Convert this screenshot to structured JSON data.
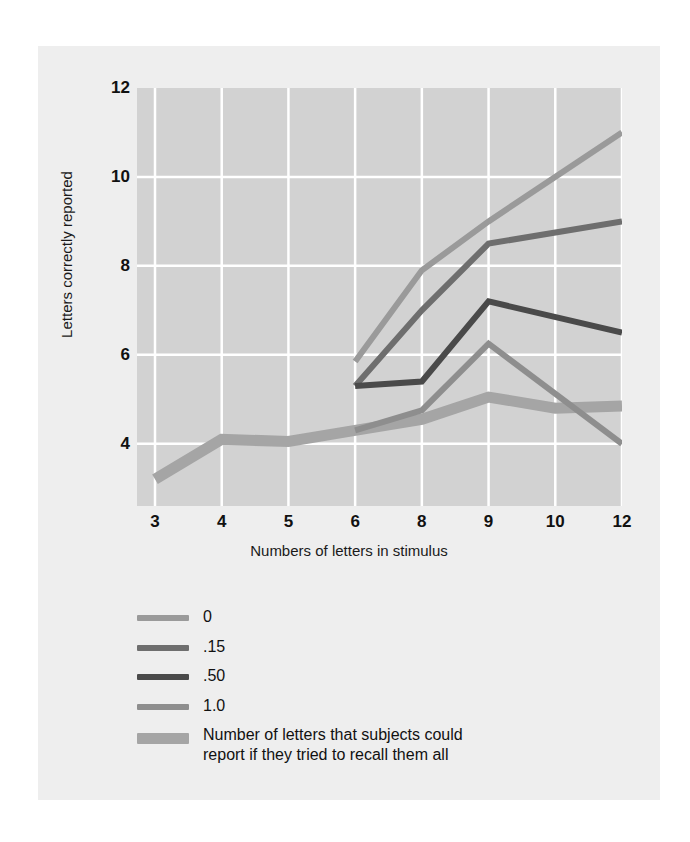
{
  "figure": {
    "background": "#eeeeee",
    "plot_background": "#d2d2d2",
    "gridline_color": "#ffffff"
  },
  "axes": {
    "ylabel": "Letters correctly reported",
    "xlabel": "Numbers of letters in stimulus",
    "yticks": [
      "4",
      "6",
      "8",
      "10",
      "12"
    ],
    "xticks": [
      "3",
      "4",
      "5",
      "6",
      "8",
      "9",
      "10",
      "12"
    ]
  },
  "legend": {
    "items": [
      {
        "label": "0",
        "color": "#9a9a9a",
        "thickness": 6
      },
      {
        "label": ".15",
        "color": "#6e6e6e",
        "thickness": 6
      },
      {
        "label": ".50",
        "color": "#4a4a4a",
        "thickness": 6
      },
      {
        "label": "1.0",
        "color": "#8e8e8e",
        "thickness": 6
      },
      {
        "label": "Number of letters that subjects could",
        "label_line2": "report if they tried to recall them all",
        "color": "#a5a5a5",
        "thickness": 11
      }
    ]
  },
  "chart_data": {
    "type": "line",
    "title": "",
    "xlabel": "Numbers of letters in stimulus",
    "ylabel": "Letters correctly reported",
    "categories": [
      "3",
      "4",
      "5",
      "6",
      "8",
      "9",
      "10",
      "12"
    ],
    "xlim": [
      0,
      7
    ],
    "ylim": [
      2.6,
      12
    ],
    "grid": true,
    "legend_position": "below",
    "series": [
      {
        "name": "0",
        "color": "#9a9a9a",
        "thickness": 6,
        "x": [
          "6",
          "8",
          "9",
          "12"
        ],
        "values": [
          5.85,
          7.9,
          9.0,
          11.0
        ]
      },
      {
        "name": ".15",
        "color": "#6e6e6e",
        "thickness": 6,
        "x": [
          "6",
          "8",
          "9",
          "12"
        ],
        "values": [
          5.3,
          7.0,
          8.5,
          9.0
        ]
      },
      {
        "name": ".50",
        "color": "#4a4a4a",
        "thickness": 6,
        "x": [
          "6",
          "8",
          "9",
          "12"
        ],
        "values": [
          5.3,
          5.4,
          7.2,
          6.5
        ]
      },
      {
        "name": "1.0",
        "color": "#8e8e8e",
        "thickness": 6,
        "x": [
          "6",
          "8",
          "9",
          "12"
        ],
        "values": [
          4.3,
          4.75,
          6.25,
          4.0
        ]
      },
      {
        "name": "Number of letters that subjects could report if they tried to recall them all",
        "color": "#a5a5a5",
        "thickness": 11,
        "x": [
          "3",
          "4",
          "5",
          "6",
          "8",
          "9",
          "10",
          "12"
        ],
        "values": [
          3.2,
          4.1,
          4.05,
          4.3,
          4.55,
          5.05,
          4.8,
          4.85
        ]
      }
    ]
  }
}
